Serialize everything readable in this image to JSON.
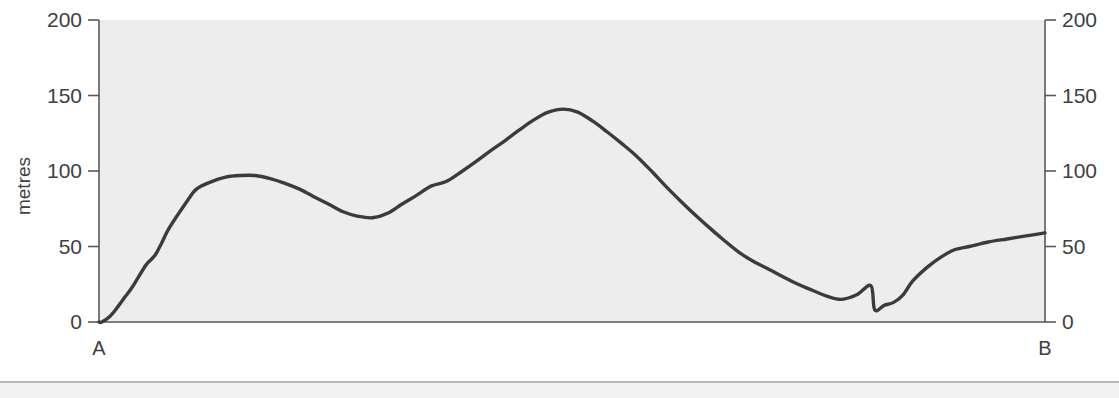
{
  "figure": {
    "background_color": "#ffffff",
    "plot_background_color": "#ededed",
    "line_color": "#3b3b3b",
    "axis_color": "#595959"
  },
  "axes": {
    "y_left_title": "metres",
    "y_left_ticks": [
      "200",
      "150",
      "100",
      "50",
      "0"
    ],
    "y_right_ticks": [
      "200",
      "150",
      "100",
      "50",
      "0"
    ],
    "x_start_label": "A",
    "x_end_label": "B"
  },
  "chart_data": {
    "type": "line",
    "title": "",
    "subtitle": "",
    "xlabel": "",
    "ylabel": "metres",
    "xlim": [
      0,
      100
    ],
    "ylim": [
      0,
      200
    ],
    "x_tick_labels": [
      "A",
      "B"
    ],
    "x_tick_values": [
      0,
      100
    ],
    "y_ticks": [
      0,
      50,
      100,
      150,
      200
    ],
    "grid": false,
    "legend": "none",
    "series": [
      {
        "name": "Ground surface profile A-B",
        "x": [
          0.0,
          0.3,
          1.2,
          2.1,
          2.8,
          3.4,
          4.1,
          5.0,
          5.9,
          6.6,
          7.4,
          9.2,
          10.3,
          11.9,
          13.4,
          15.0,
          16.5,
          18.1,
          19.6,
          21.2,
          22.7,
          24.3,
          25.8,
          27.4,
          28.9,
          30.5,
          32.0,
          33.6,
          35.1,
          36.7,
          38.2,
          39.8,
          41.3,
          42.9,
          44.4,
          46.0,
          47.5,
          49.1,
          50.6,
          52.2,
          53.7,
          55.3,
          56.8,
          58.4,
          59.9,
          61.5,
          63.0,
          64.6,
          66.1,
          67.7,
          69.2,
          70.8,
          72.3,
          73.9,
          75.4,
          77.0,
          78.5,
          80.1,
          81.6,
          83.2,
          84.7,
          86.3,
          87.8,
          89.4,
          90.9,
          92.5,
          94.0,
          95.6,
          97.1,
          98.6,
          100.0
        ],
        "y": [
          0,
          0,
          4,
          11,
          17,
          22,
          29,
          38,
          44,
          52,
          62,
          79,
          88,
          93,
          96,
          97,
          97,
          95,
          92,
          88,
          83,
          78,
          73,
          70,
          69,
          72,
          78,
          84,
          90,
          93,
          99,
          106,
          113,
          120,
          127,
          134,
          139,
          141,
          139,
          133,
          126,
          118,
          110,
          100,
          90,
          80,
          71,
          62,
          54,
          46,
          40,
          35,
          30,
          25,
          21,
          17,
          15,
          18,
          24,
          28,
          27,
          22,
          16,
          11,
          7,
          6,
          6,
          6,
          7,
          9,
          10
        ],
        "note": "Long profile of the ground surface between points A and B"
      }
    ],
    "series_extension": {
      "name": "Ground surface profile A-B (continued, right portion)",
      "x": [
        82.0,
        83.0,
        84.0,
        85.0,
        86.0,
        87.5,
        89.0,
        90.5,
        92.0,
        94.0,
        96.0,
        98.0,
        100.0
      ],
      "y": [
        8,
        11,
        13,
        18,
        27,
        36,
        43,
        48,
        50,
        53,
        55,
        57,
        59
      ]
    },
    "key_points": [
      {
        "label": "start at A",
        "x": 0,
        "y": 0
      },
      {
        "label": "first summit",
        "x": 15.8,
        "y": 97
      },
      {
        "label": "first col",
        "x": 28.3,
        "y": 69
      },
      {
        "label": "main summit",
        "x": 49.1,
        "y": 141
      },
      {
        "label": "valley floor",
        "x": 78.5,
        "y": 15
      },
      {
        "label": "minor knoll",
        "x": 82.2,
        "y": 28
      },
      {
        "label": "lowest flat",
        "x": 89.0,
        "y": 5
      },
      {
        "label": "end at B",
        "x": 100,
        "y": 59
      }
    ]
  }
}
